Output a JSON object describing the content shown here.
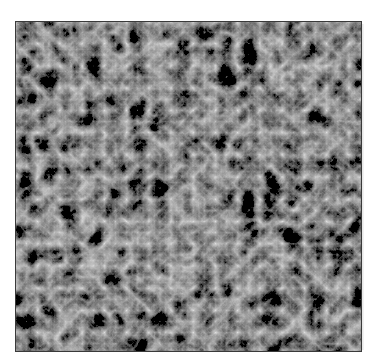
{
  "image": {
    "description": "Grayscale turbulent noise texture in a thin dark frame",
    "colors": {
      "background": "#ffffff",
      "border": "#3a3a3a",
      "texture_base": "#8a8a8a",
      "texture_dark": "#3c3c3c",
      "texture_light": "#c8c8c8"
    },
    "frame": {
      "x": 15,
      "y": 21,
      "width": 346,
      "height": 330
    },
    "texture": {
      "type": "fractal-turbulence",
      "base_frequency": 0.045,
      "octaves": 5,
      "seed": 7
    }
  }
}
